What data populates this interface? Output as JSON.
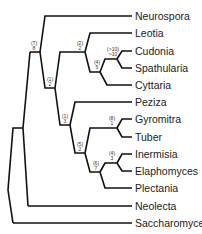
{
  "diagram": {
    "type": "phylogenetic-tree",
    "taxa": [
      "Neurospora",
      "Leotia",
      "Cudonia",
      "Spathularia",
      "Cyttaria",
      "Peziza",
      "Gyromitra",
      "Tuber",
      "Inermisia",
      "Elaphomyces",
      "Plectania",
      "Neolecta",
      "Saccharomyces"
    ],
    "node_support": {
      "n_neurospora_clade": {
        "top": "(7)",
        "bottom": "8"
      },
      "n_pezizomycotina_inner": {
        "top": "(1)",
        "bottom": "2"
      },
      "n_leotiomycetes": {
        "top": "(2)",
        "bottom": "2"
      },
      "n_cudonia_cyttaria": {
        "top": "(4)",
        "bottom": "5"
      },
      "n_cudonia_spathularia": {
        "top": "(>10)",
        "bottom": ">10"
      },
      "n_pezizales": {
        "top": "(1)",
        "bottom": "3"
      },
      "n_pezizales_inner": {
        "top": "(5)",
        "bottom": "2"
      },
      "n_gyromitra_tuber": {
        "top": "(8)",
        "bottom": "1"
      },
      "n_plectania_clade": {
        "top": "(6)",
        "bottom": "7"
      },
      "n_inermisia_elaphomyces": {
        "top": "(4)",
        "bottom": "3"
      }
    }
  }
}
